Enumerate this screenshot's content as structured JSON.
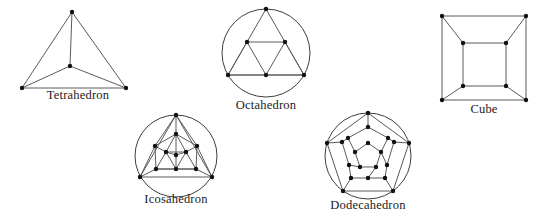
{
  "page": {
    "width": 547,
    "height": 224,
    "background": "#ffffff"
  },
  "style": {
    "edge_color": "#5a5a5a",
    "circle_color": "#3d3d3d",
    "vertex_color": "#111111",
    "label_color": "#1a1a1a",
    "edge_width": 1,
    "circle_width": 1,
    "vertex_radius": 2.2
  },
  "figures": [
    {
      "id": "tetrahedron",
      "label": "Tetrahedron",
      "vertex_count": 4,
      "edge_count": 6,
      "box": {
        "x": 8,
        "y": 4,
        "width": 140,
        "height": 86
      },
      "caption": {
        "x": 8,
        "y": 88,
        "width": 140
      },
      "circle": null,
      "vertices": [
        {
          "name": "apex",
          "x": 64,
          "y": 8
        },
        {
          "name": "center",
          "x": 62,
          "y": 62
        },
        {
          "name": "bottom-left",
          "x": 14,
          "y": 84
        },
        {
          "name": "bottom-right",
          "x": 118,
          "y": 84
        }
      ],
      "edges": [
        [
          0,
          1
        ],
        [
          0,
          2
        ],
        [
          0,
          3
        ],
        [
          1,
          2
        ],
        [
          1,
          3
        ],
        [
          2,
          3
        ]
      ]
    },
    {
      "id": "octahedron",
      "label": "Octahedron",
      "vertex_count": 6,
      "edge_count": 12,
      "box": {
        "x": 218,
        "y": 8,
        "width": 96,
        "height": 90
      },
      "caption": {
        "x": 214,
        "y": 98,
        "width": 104
      },
      "circle": {
        "cx": 48,
        "cy": 45,
        "r": 44
      },
      "vertices": [
        {
          "name": "outer-top",
          "x": 48,
          "y": 1
        },
        {
          "name": "outer-bottom-left",
          "x": 10,
          "y": 67
        },
        {
          "name": "outer-bottom-right",
          "x": 86,
          "y": 67
        },
        {
          "name": "mid-left",
          "x": 29,
          "y": 34
        },
        {
          "name": "mid-right",
          "x": 67,
          "y": 34
        },
        {
          "name": "mid-bottom",
          "x": 48,
          "y": 67
        }
      ],
      "edges": [
        [
          0,
          3
        ],
        [
          0,
          4
        ],
        [
          3,
          4
        ],
        [
          3,
          1
        ],
        [
          4,
          2
        ],
        [
          1,
          5
        ],
        [
          5,
          2
        ],
        [
          3,
          5
        ],
        [
          4,
          5
        ],
        [
          1,
          3
        ],
        [
          2,
          4
        ],
        [
          1,
          2
        ]
      ]
    },
    {
      "id": "cube",
      "label": "Cube",
      "vertex_count": 8,
      "edge_count": 12,
      "box": {
        "x": 440,
        "y": 14,
        "width": 90,
        "height": 88
      },
      "caption": {
        "x": 438,
        "y": 102,
        "width": 92
      },
      "circle": null,
      "vertices": [
        {
          "name": "outer-top-left",
          "x": 2,
          "y": 2
        },
        {
          "name": "outer-top-right",
          "x": 86,
          "y": 2
        },
        {
          "name": "outer-bottom-right",
          "x": 86,
          "y": 86
        },
        {
          "name": "outer-bottom-left",
          "x": 2,
          "y": 86
        },
        {
          "name": "inner-top-left",
          "x": 23,
          "y": 29
        },
        {
          "name": "inner-top-right",
          "x": 66,
          "y": 29
        },
        {
          "name": "inner-bottom-right",
          "x": 66,
          "y": 72
        },
        {
          "name": "inner-bottom-left",
          "x": 23,
          "y": 72
        }
      ],
      "edges": [
        [
          0,
          1
        ],
        [
          1,
          2
        ],
        [
          2,
          3
        ],
        [
          3,
          0
        ],
        [
          4,
          5
        ],
        [
          5,
          6
        ],
        [
          6,
          7
        ],
        [
          7,
          4
        ],
        [
          0,
          4
        ],
        [
          1,
          5
        ],
        [
          2,
          6
        ],
        [
          3,
          7
        ]
      ]
    },
    {
      "id": "icosahedron",
      "label": "Icosahedron",
      "vertex_count": 12,
      "edge_count": 30,
      "box": {
        "x": 128,
        "y": 114,
        "width": 96,
        "height": 80
      },
      "caption": {
        "x": 126,
        "y": 192,
        "width": 100
      },
      "circle": {
        "cx": 48,
        "cy": 42,
        "r": 41
      },
      "vertices": [
        {
          "name": "outer-top",
          "x": 48,
          "y": 1
        },
        {
          "name": "outer-bottom-left",
          "x": 12,
          "y": 63
        },
        {
          "name": "outer-bottom-right",
          "x": 84,
          "y": 63
        },
        {
          "name": "mid-top",
          "x": 48,
          "y": 20
        },
        {
          "name": "mid-left",
          "x": 27,
          "y": 32
        },
        {
          "name": "mid-right",
          "x": 69,
          "y": 32
        },
        {
          "name": "mid-bottom-left",
          "x": 28,
          "y": 55
        },
        {
          "name": "mid-bottom-right",
          "x": 68,
          "y": 55
        },
        {
          "name": "inner-left",
          "x": 38,
          "y": 38
        },
        {
          "name": "inner-right",
          "x": 58,
          "y": 38
        },
        {
          "name": "inner-bottom",
          "x": 48,
          "y": 55
        },
        {
          "name": "core",
          "x": 48,
          "y": 41
        }
      ],
      "edges": [
        [
          0,
          3
        ],
        [
          0,
          4
        ],
        [
          0,
          5
        ],
        [
          0,
          1
        ],
        [
          0,
          2
        ],
        [
          1,
          2
        ],
        [
          1,
          4
        ],
        [
          1,
          6
        ],
        [
          2,
          5
        ],
        [
          2,
          7
        ],
        [
          3,
          4
        ],
        [
          3,
          5
        ],
        [
          3,
          8
        ],
        [
          3,
          9
        ],
        [
          4,
          6
        ],
        [
          4,
          8
        ],
        [
          5,
          7
        ],
        [
          5,
          9
        ],
        [
          6,
          7
        ],
        [
          6,
          8
        ],
        [
          6,
          10
        ],
        [
          7,
          9
        ],
        [
          7,
          10
        ],
        [
          8,
          9
        ],
        [
          8,
          10
        ],
        [
          9,
          10
        ],
        [
          8,
          11
        ],
        [
          9,
          11
        ],
        [
          10,
          11
        ],
        [
          3,
          11
        ]
      ]
    },
    {
      "id": "dodecahedron",
      "label": "Dodecahedron",
      "vertex_count": 20,
      "edge_count": 30,
      "box": {
        "x": 322,
        "y": 112,
        "width": 92,
        "height": 88
      },
      "caption": {
        "x": 318,
        "y": 198,
        "width": 100
      },
      "circle": {
        "cx": 46,
        "cy": 44,
        "r": 43
      },
      "vertices": [
        {
          "name": "outer-1",
          "x": 46,
          "y": 1
        },
        {
          "name": "outer-2",
          "x": 87,
          "y": 31
        },
        {
          "name": "outer-3",
          "x": 71,
          "y": 79
        },
        {
          "name": "outer-4",
          "x": 21,
          "y": 79
        },
        {
          "name": "outer-5",
          "x": 5,
          "y": 31
        },
        {
          "name": "ring-1a",
          "x": 46,
          "y": 15
        },
        {
          "name": "ring-1b",
          "x": 66,
          "y": 26
        },
        {
          "name": "ring-2a",
          "x": 72,
          "y": 30
        },
        {
          "name": "ring-2b",
          "x": 65,
          "y": 53
        },
        {
          "name": "ring-3a",
          "x": 63,
          "y": 66
        },
        {
          "name": "ring-3b",
          "x": 46,
          "y": 66
        },
        {
          "name": "ring-4a",
          "x": 29,
          "y": 66
        },
        {
          "name": "ring-4b",
          "x": 27,
          "y": 53
        },
        {
          "name": "ring-5a",
          "x": 20,
          "y": 30
        },
        {
          "name": "ring-5b",
          "x": 26,
          "y": 26
        },
        {
          "name": "inner-1",
          "x": 46,
          "y": 31
        },
        {
          "name": "inner-2",
          "x": 59,
          "y": 40
        },
        {
          "name": "inner-3",
          "x": 54,
          "y": 55
        },
        {
          "name": "inner-4",
          "x": 38,
          "y": 55
        },
        {
          "name": "inner-5",
          "x": 33,
          "y": 40
        }
      ],
      "edges": [
        [
          0,
          1
        ],
        [
          1,
          2
        ],
        [
          2,
          3
        ],
        [
          3,
          4
        ],
        [
          4,
          0
        ],
        [
          0,
          5
        ],
        [
          1,
          7
        ],
        [
          2,
          9
        ],
        [
          3,
          11
        ],
        [
          4,
          13
        ],
        [
          5,
          6
        ],
        [
          6,
          7
        ],
        [
          7,
          8
        ],
        [
          8,
          9
        ],
        [
          9,
          10
        ],
        [
          10,
          11
        ],
        [
          11,
          12
        ],
        [
          12,
          13
        ],
        [
          13,
          14
        ],
        [
          14,
          5
        ],
        [
          6,
          16
        ],
        [
          8,
          16
        ],
        [
          10,
          17
        ],
        [
          12,
          18
        ],
        [
          14,
          19
        ],
        [
          15,
          16
        ],
        [
          16,
          17
        ],
        [
          17,
          18
        ],
        [
          18,
          19
        ],
        [
          19,
          15
        ]
      ]
    }
  ]
}
